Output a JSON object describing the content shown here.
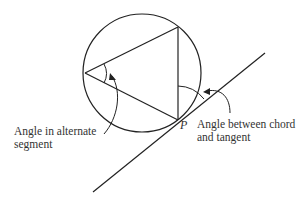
{
  "diagram": {
    "colors": {
      "stroke": "#222222",
      "text": "#333333",
      "background": "#ffffff"
    },
    "point_label": "P",
    "labels": {
      "alternate_segment": {
        "line1": "Angle in alternate",
        "line2": "segment"
      },
      "chord_tangent": {
        "line1": "Angle between chord",
        "line2": "and tangent"
      }
    },
    "shapes": {
      "circle": {
        "cx": 142,
        "cy": 73,
        "r": 59
      },
      "triangle": {
        "vertices": [
          [
            85,
            73
          ],
          [
            178,
            27
          ],
          [
            178,
            120
          ]
        ]
      },
      "tangent": {
        "x1": 93,
        "y1": 192,
        "x2": 265,
        "y2": 53
      }
    }
  }
}
